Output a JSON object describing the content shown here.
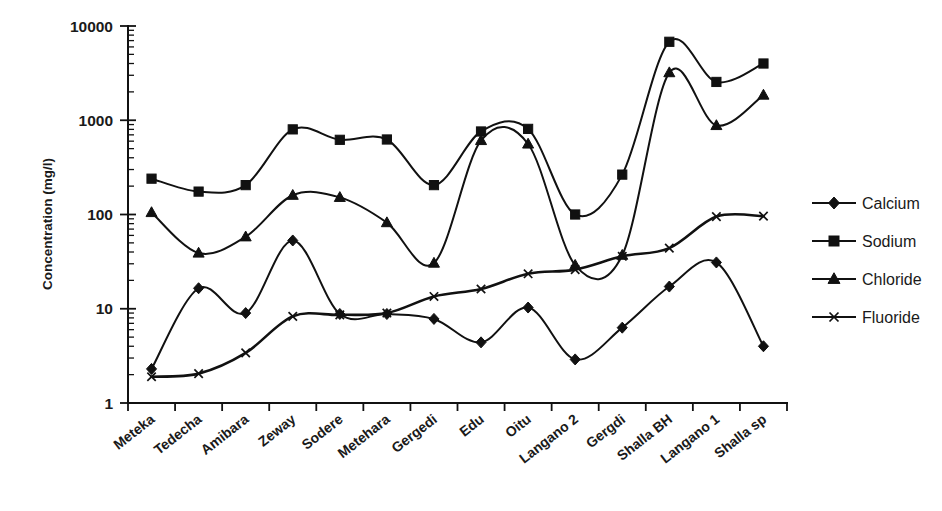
{
  "chart_data": {
    "type": "line",
    "title": "",
    "xlabel": "",
    "ylabel": "Concentration (mg/l)",
    "yscale": "log",
    "ylim": [
      1,
      10000
    ],
    "ytick_labels": [
      "1",
      "10",
      "100",
      "1000",
      "10000"
    ],
    "grid": false,
    "legend_position": "right",
    "categories": [
      "Meteka",
      "Tedecha",
      "Amibara",
      "Zeway",
      "Sodere",
      "Metehara",
      "Gergedi",
      "Edu",
      "Oitu",
      "Langano 2",
      "Gergdi",
      "Shalla BH",
      "Langano 1",
      "Shalla sp"
    ],
    "series": [
      {
        "name": "Calcium",
        "marker": "diamond",
        "values": [
          2.3,
          16.5,
          9.0,
          53,
          8.8,
          8.8,
          7.8,
          4.4,
          10.3,
          2.9,
          6.3,
          17.2,
          31,
          4.0
        ]
      },
      {
        "name": "Sodium",
        "marker": "square",
        "values": [
          240,
          175,
          205,
          800,
          620,
          625,
          205,
          760,
          810,
          100,
          265,
          6800,
          2550,
          4000
        ]
      },
      {
        "name": "Chloride",
        "marker": "triangle",
        "values": [
          105,
          39,
          58,
          160,
          152,
          82,
          30.5,
          610,
          560,
          29,
          37,
          3200,
          880,
          1850
        ]
      },
      {
        "name": "Fluoride",
        "marker": "cross",
        "values": [
          1.9,
          2.05,
          3.4,
          8.3,
          8.6,
          9.0,
          13.5,
          16.2,
          23.5,
          26,
          36,
          44,
          95,
          96
        ]
      }
    ]
  },
  "legend": {
    "items": [
      {
        "label": "Calcium",
        "marker": "diamond"
      },
      {
        "label": "Sodium",
        "marker": "square"
      },
      {
        "label": "Chloride",
        "marker": "triangle"
      },
      {
        "label": "Fluoride",
        "marker": "cross"
      }
    ]
  },
  "colors": {
    "ink": "#111111",
    "background": "#ffffff"
  }
}
